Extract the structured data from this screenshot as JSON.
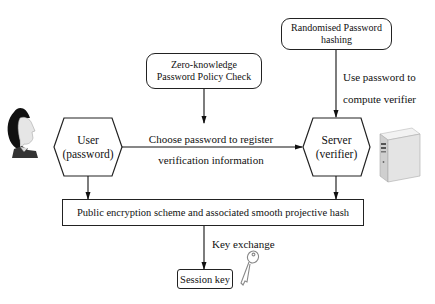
{
  "diagram": {
    "nodes": {
      "user": {
        "line1": "User",
        "line2": "(password)",
        "shape": "hexagon"
      },
      "server": {
        "line1": "Server",
        "line2": "(verifier)",
        "shape": "hexagon"
      },
      "zk_check": {
        "line1": "Zero-knowledge",
        "line2": "Password Policy Check",
        "shape": "rounded-rect"
      },
      "rand_hash": {
        "line1": "Randomised Password",
        "line2": "hashing",
        "shape": "rounded-rect"
      },
      "public_scheme": {
        "label": "Public encryption scheme and associated smooth projective hash",
        "shape": "rect"
      },
      "session_key": {
        "label": "Session key",
        "shape": "rounded-rect"
      }
    },
    "edges": {
      "register": {
        "line1": "Choose password to register",
        "line2": "verification information"
      },
      "verifier": {
        "line1": "Use password to",
        "line2": "compute verifier"
      },
      "key_exchange": {
        "label": "Key exchange"
      }
    },
    "icons": {
      "user_avatar": "woman-avatar-icon",
      "server_tower": "server-tower-icon",
      "key": "key-icon"
    },
    "colors": {
      "stroke": "#222222",
      "background": "#ffffff",
      "avatar_hair": "#111111",
      "server_body": "#dcdcdc"
    }
  }
}
